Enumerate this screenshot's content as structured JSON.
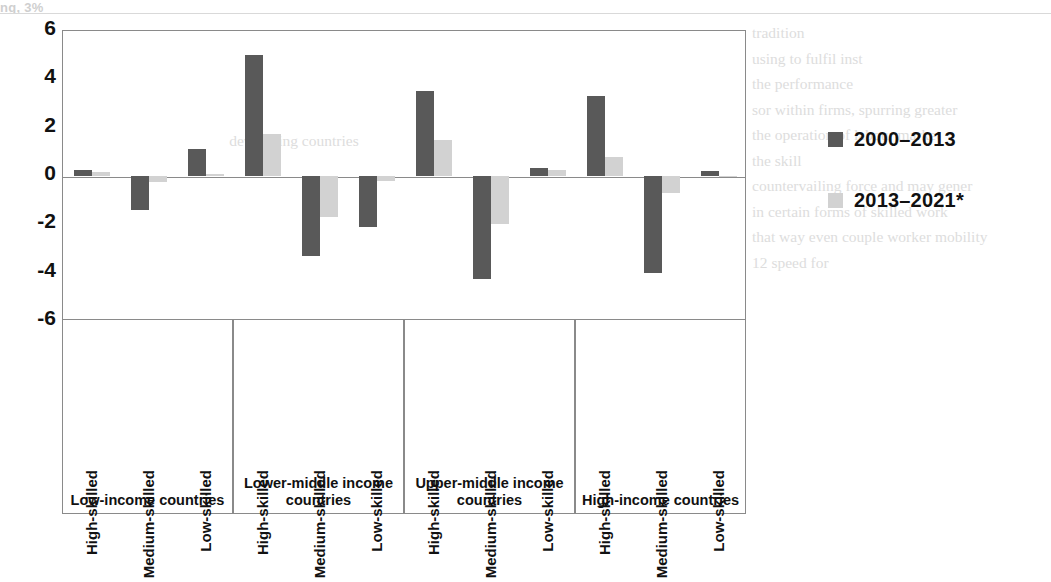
{
  "page": {
    "bleed_top_text": "ng, 3%",
    "ghost_left": "                                                          \n                                                                     \n                                                                     \n                                                                     \n                                       developing countries          \n                                                                     \n                                                                     \n                                                                     \n                                                                     \n                                                                     \n",
    "ghost_right": "tradition\nusing to fulfil inst\nthe performance\nsor within firms, spurring greater\nthe operation of labour market\nthe skill\ncountervailing force and may gener\nin certain forms of skilled work\nthat way even couple worker mobility\n12 speed for"
  },
  "chart_data": {
    "type": "bar",
    "title": "",
    "xlabel": "",
    "ylabel": "",
    "ylim": [
      -6,
      6
    ],
    "yticks": [
      6,
      4,
      2,
      0,
      -2,
      -4,
      -6
    ],
    "grid": false,
    "legend_position": "right",
    "categories": [
      "High-skilled",
      "Medium-skilled",
      "Low-skilled"
    ],
    "groups": [
      {
        "name": "Low-income countries",
        "bars": [
          {
            "category": "High-skilled",
            "series": [
              0.25,
              0.15
            ]
          },
          {
            "category": "Medium-skilled",
            "series": [
              -1.4,
              -0.25
            ]
          },
          {
            "category": "Low-skilled",
            "series": [
              1.1,
              0.1
            ]
          }
        ]
      },
      {
        "name": "Lower-middle income countries",
        "bars": [
          {
            "category": "High-skilled",
            "series": [
              5.0,
              1.75
            ]
          },
          {
            "category": "Medium-skilled",
            "series": [
              -3.3,
              -1.7
            ]
          },
          {
            "category": "Low-skilled",
            "series": [
              -2.1,
              -0.2
            ]
          }
        ]
      },
      {
        "name": "Upper-middle income countries",
        "bars": [
          {
            "category": "High-skilled",
            "series": [
              3.5,
              1.5
            ]
          },
          {
            "category": "Medium-skilled",
            "series": [
              -4.25,
              -2.0
            ]
          },
          {
            "category": "Low-skilled",
            "series": [
              0.35,
              0.25
            ]
          }
        ]
      },
      {
        "name": "High-income countries",
        "bars": [
          {
            "category": "High-skilled",
            "series": [
              3.3,
              0.8
            ]
          },
          {
            "category": "Medium-skilled",
            "series": [
              -4.0,
              -0.7
            ]
          },
          {
            "category": "Low-skilled",
            "series": [
              0.2,
              0.02
            ]
          }
        ]
      }
    ],
    "series": [
      {
        "name": "2000–2013",
        "color": "#595959"
      },
      {
        "name": "2013–2021*",
        "color": "#d2d2d2"
      }
    ]
  }
}
